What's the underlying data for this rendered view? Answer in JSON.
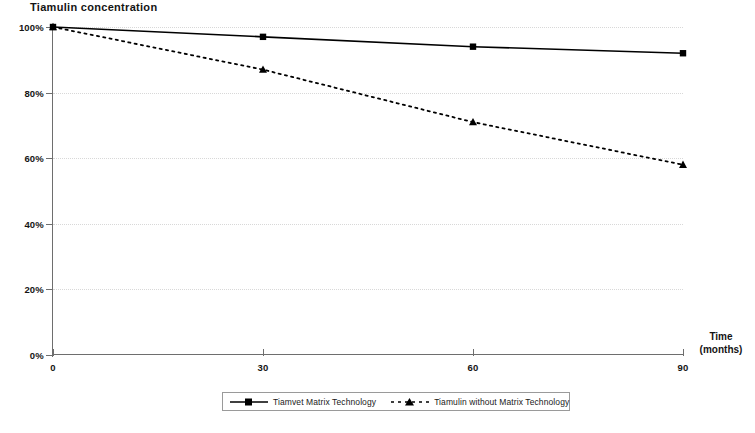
{
  "chart_data": {
    "type": "line",
    "title": "Tiamulin concentration",
    "xlabel_line1": "Time",
    "xlabel_line2": "(months)",
    "ylabel": "",
    "x": [
      0,
      30,
      60,
      90
    ],
    "xtick_labels": [
      "0",
      "30",
      "60",
      "90"
    ],
    "ytick_labels": [
      "0%",
      "20%",
      "40%",
      "60%",
      "80%",
      "100%"
    ],
    "ytick_values": [
      0,
      20,
      40,
      60,
      80,
      100
    ],
    "xlim": [
      0,
      90
    ],
    "ylim": [
      0,
      100
    ],
    "grid": true,
    "grid_axis": "y",
    "legend_position": "bottom",
    "series": [
      {
        "name": "Tiamvet Matrix Technology",
        "values": [
          100,
          97,
          94,
          92
        ],
        "marker": "square",
        "linestyle": "solid",
        "color": "#000000"
      },
      {
        "name": "Tiamulin without Matrix Technology",
        "values": [
          100,
          87,
          71,
          58
        ],
        "marker": "triangle",
        "linestyle": "dotted",
        "color": "#000000"
      }
    ]
  },
  "legend": {
    "entries": [
      {
        "label": "Tiamvet Matrix Technology"
      },
      {
        "label": "Tiamulin without Matrix Technology"
      }
    ]
  },
  "colors": {
    "axis": "#6e6e6e",
    "grid": "#d8d8d8",
    "series": "#000000",
    "text": "#141414",
    "background": "#ffffff"
  }
}
